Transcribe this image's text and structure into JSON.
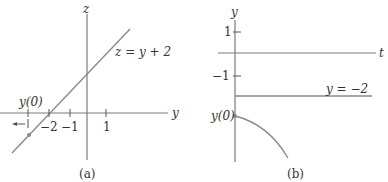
{
  "panels": [
    {
      "id": "a",
      "caption": "(a)",
      "axes": {
        "horizontal": "y",
        "vertical": "z"
      },
      "line_label": "z = y + 2",
      "ticks": [
        {
          "label": "−2",
          "value": -2
        },
        {
          "label": "−1",
          "value": -1
        },
        {
          "label": "1",
          "value": 1
        }
      ],
      "initial_point_label": "y(0)",
      "arrow_direction": "left"
    },
    {
      "id": "b",
      "caption": "(b)",
      "axes": {
        "horizontal": "t",
        "vertical": "y"
      },
      "ticks": [
        {
          "label": "1",
          "value": 1
        },
        {
          "label": "−1",
          "value": -1
        }
      ],
      "equilibrium_label": "y = −2",
      "initial_point_label": "y(0)"
    }
  ],
  "colors": {
    "axis": "#7a7a7a",
    "curve": "#8a8a8a",
    "text": "#333333"
  }
}
